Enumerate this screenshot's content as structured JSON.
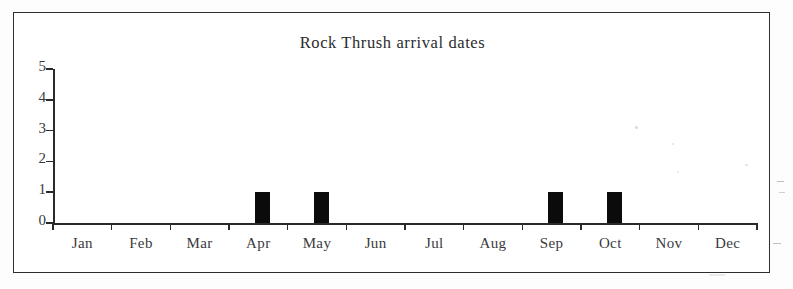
{
  "chart_data": {
    "type": "bar",
    "title": "Rock Thrush arrival dates",
    "xlabel": "",
    "ylabel": "",
    "categories": [
      "Jan",
      "Feb",
      "Mar",
      "Apr",
      "May",
      "Jun",
      "Jul",
      "Aug",
      "Sep",
      "Oct",
      "Nov",
      "Dec"
    ],
    "values": [
      0,
      0,
      0,
      1,
      1,
      0,
      0,
      0,
      1,
      1,
      0,
      0
    ],
    "ylim": [
      0,
      5
    ],
    "ytick_labels": [
      "0",
      "1",
      "2",
      "3",
      "4",
      "5"
    ],
    "ytick_values": [
      0,
      1,
      2,
      3,
      4,
      5
    ],
    "grid": false,
    "legend": null,
    "series": [
      {
        "name": "Arrivals",
        "values": [
          0,
          0,
          0,
          1,
          1,
          0,
          0,
          0,
          1,
          1,
          0,
          0
        ],
        "color": "#0b0b0b"
      }
    ]
  },
  "figure": {
    "border_color": "#2e2e30",
    "axis_color": "#2a2a2c",
    "bar_color": "#0b0b0b",
    "background": "#ffffff"
  }
}
